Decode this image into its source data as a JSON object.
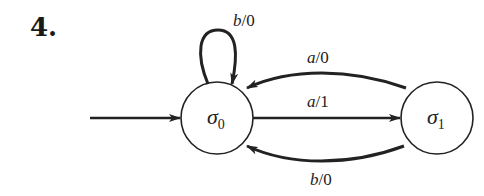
{
  "problem_number": "4.",
  "states": [
    {
      "id": "s0",
      "symbol": "σ",
      "subscript": "0",
      "initial": true
    },
    {
      "id": "s1",
      "symbol": "σ",
      "subscript": "1",
      "initial": false
    }
  ],
  "transitions": [
    {
      "from": "s0",
      "to": "s0",
      "input": "b",
      "output": "0",
      "label_sep": "/"
    },
    {
      "from": "s1",
      "to": "s0",
      "input": "a",
      "output": "0",
      "label_sep": "/"
    },
    {
      "from": "s0",
      "to": "s1",
      "input": "a",
      "output": "1",
      "label_sep": "/"
    },
    {
      "from": "s1",
      "to": "s0",
      "input": "b",
      "output": "0",
      "label_sep": "/"
    }
  ],
  "colors": {
    "stroke": "#222222",
    "background": "#ffffff"
  }
}
